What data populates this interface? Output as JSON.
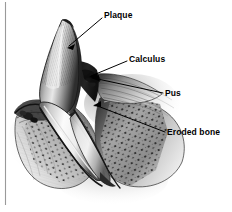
{
  "figure": {
    "background_color": "#ffffff",
    "line_color": "#000000",
    "rule_color": "#9a9a9a",
    "width": 232,
    "height": 212
  },
  "callouts": [
    {
      "id": "plaque",
      "label": "Plaque",
      "text_x": 104,
      "text_y": 10,
      "leader_from_x": 102,
      "leader_from_y": 18,
      "leader_to_x": 67,
      "leader_to_y": 48
    },
    {
      "id": "calculus",
      "label": "Calculus",
      "text_x": 129,
      "text_y": 54,
      "leader_from_x": 127,
      "leader_from_y": 61,
      "leader_to_x": 89,
      "leader_to_y": 77
    },
    {
      "id": "pus",
      "label": "Pus",
      "text_x": 165,
      "text_y": 88,
      "leader_from_x": 163,
      "leader_from_y": 93,
      "leader_to_x": 91,
      "leader_to_y": 79
    },
    {
      "id": "eroded-bone",
      "label": "Eroded bone",
      "text_x": 167,
      "text_y": 127,
      "leader_from_x": 165,
      "leader_from_y": 132,
      "leader_to_x": 93,
      "leader_to_y": 106
    }
  ],
  "anatomy": {
    "plaque_layer": "Plaque",
    "calculus_deposit": "Calculus",
    "pus_exudate": "Pus",
    "eroded_bone": "Eroded bone",
    "tooth_crown": "Tooth crown",
    "tooth_root": "Tooth root",
    "gum_tissue": "Gum tissue",
    "alveolar_bone": "Alveolar bone"
  },
  "margin_rule": {
    "x": 5,
    "y_top": 2,
    "y_bottom": 205
  }
}
